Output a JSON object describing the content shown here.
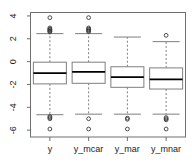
{
  "chart_data": {
    "type": "box",
    "title": "",
    "xlabel": "",
    "ylabel": "",
    "categories": [
      "y",
      "y_mcar",
      "y_mar",
      "y_mnar"
    ],
    "ylim": [
      -6.6,
      4.3
    ],
    "yticks": [
      4,
      2,
      0,
      -2,
      -4,
      -6
    ],
    "ytick_labels": [
      "4",
      "2",
      "0",
      "-2",
      "-4",
      "-6"
    ],
    "grid": false,
    "legend": false,
    "frame": true,
    "box_color": "#7f7f7f",
    "median_color": "#000000",
    "whisker_style": "dashed",
    "outlier_marker": "open-circle",
    "series": [
      {
        "name": "y",
        "min_whisker": -4.65,
        "q1": -1.95,
        "median": -1.0,
        "q3": -0.05,
        "max_whisker": 2.45,
        "outliers": [
          3.85,
          2.95,
          2.85,
          2.8,
          2.72,
          2.65,
          2.6,
          -4.8,
          -4.9,
          -5.0,
          -5.9
        ]
      },
      {
        "name": "y_mcar",
        "min_whisker": -4.6,
        "q1": -1.9,
        "median": -0.9,
        "q3": -0.05,
        "max_whisker": 2.45,
        "outliers": [
          3.85,
          2.95,
          2.85,
          2.78,
          2.7,
          2.62,
          -5.0,
          -5.9
        ]
      },
      {
        "name": "y_mar",
        "min_whisker": -4.6,
        "q1": -2.25,
        "median": -1.35,
        "q3": -0.45,
        "max_whisker": 2.15,
        "outliers": [
          -4.95,
          -5.05,
          -5.9
        ]
      },
      {
        "name": "y_mnar",
        "min_whisker": -4.6,
        "q1": -2.4,
        "median": -1.55,
        "q3": -0.55,
        "max_whisker": 1.75,
        "outliers": [
          2.3,
          -4.9,
          -5.0,
          -5.1,
          -5.9
        ]
      }
    ]
  },
  "axes": {
    "y_tick_labels": [
      "4",
      "2",
      "0",
      "-2",
      "-4",
      "-6"
    ],
    "x_tick_labels": [
      "y",
      "y_mcar",
      "y_mar",
      "y_mnar"
    ]
  }
}
